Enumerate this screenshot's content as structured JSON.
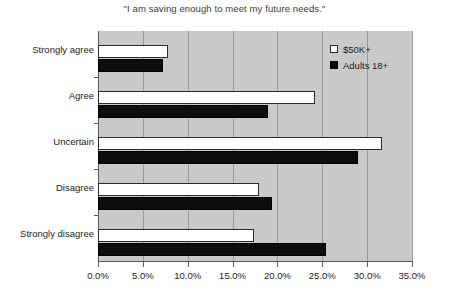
{
  "chart_data": {
    "type": "bar",
    "orientation": "horizontal",
    "title": "\"I am saving enough to meet my future needs.\"",
    "xlabel": "",
    "ylabel": "",
    "categories": [
      "Strongly agree",
      "Agree",
      "Uncertain",
      "Disagree",
      "Strongly disagree"
    ],
    "series": [
      {
        "name": "$50K+",
        "color": "#ffffff",
        "values": [
          7.8,
          24.2,
          31.7,
          18.0,
          17.4
        ]
      },
      {
        "name": "Adults 18+",
        "color": "#0d0d0d",
        "values": [
          7.3,
          19.0,
          29.0,
          19.4,
          25.4
        ]
      }
    ],
    "xlim": [
      0,
      35
    ],
    "xticks": [
      0,
      5,
      10,
      15,
      20,
      25,
      30,
      35
    ],
    "xtick_labels": [
      "0.0%",
      "5.0%",
      "10.0%",
      "15.0%",
      "20.0%",
      "25.0%",
      "30.0%",
      "35.0%"
    ],
    "grid": {
      "vertical": true,
      "horizontal": false
    },
    "legend_position": "top-right",
    "plot_background": "#c9c9c9",
    "figure_background": "#ffffff",
    "axis_color": "#5a5a5a",
    "gridline_color": "#9a9a9a"
  }
}
